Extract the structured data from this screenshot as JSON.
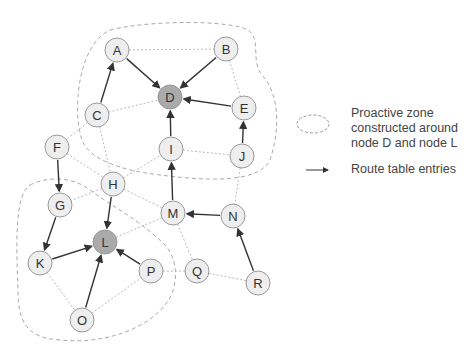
{
  "diagram": {
    "nodes": [
      {
        "id": "A",
        "x": 117,
        "y": 50,
        "highlight": false
      },
      {
        "id": "B",
        "x": 226,
        "y": 49,
        "highlight": false
      },
      {
        "id": "C",
        "x": 97,
        "y": 115,
        "highlight": false
      },
      {
        "id": "D",
        "x": 170,
        "y": 97,
        "highlight": true
      },
      {
        "id": "E",
        "x": 244,
        "y": 108,
        "highlight": false
      },
      {
        "id": "F",
        "x": 57,
        "y": 147,
        "highlight": false
      },
      {
        "id": "G",
        "x": 60,
        "y": 205,
        "highlight": false
      },
      {
        "id": "H",
        "x": 113,
        "y": 184,
        "highlight": false
      },
      {
        "id": "I",
        "x": 171,
        "y": 149,
        "highlight": false
      },
      {
        "id": "J",
        "x": 242,
        "y": 156,
        "highlight": false
      },
      {
        "id": "K",
        "x": 40,
        "y": 263,
        "highlight": false
      },
      {
        "id": "L",
        "x": 105,
        "y": 242,
        "highlight": true
      },
      {
        "id": "M",
        "x": 173,
        "y": 213,
        "highlight": false
      },
      {
        "id": "N",
        "x": 233,
        "y": 216,
        "highlight": false
      },
      {
        "id": "O",
        "x": 82,
        "y": 320,
        "highlight": false
      },
      {
        "id": "P",
        "x": 151,
        "y": 271,
        "highlight": false
      },
      {
        "id": "Q",
        "x": 197,
        "y": 271,
        "highlight": false
      },
      {
        "id": "R",
        "x": 258,
        "y": 283,
        "highlight": false
      }
    ],
    "links": [
      [
        "A",
        "B"
      ],
      [
        "B",
        "E"
      ],
      [
        "C",
        "D"
      ],
      [
        "C",
        "F"
      ],
      [
        "C",
        "H"
      ],
      [
        "F",
        "H"
      ],
      [
        "H",
        "I"
      ],
      [
        "I",
        "J"
      ],
      [
        "J",
        "N"
      ],
      [
        "H",
        "G"
      ],
      [
        "H",
        "M"
      ],
      [
        "L",
        "M"
      ],
      [
        "M",
        "Q"
      ],
      [
        "K",
        "O"
      ],
      [
        "O",
        "P"
      ],
      [
        "P",
        "Q"
      ],
      [
        "Q",
        "R"
      ]
    ],
    "routes": [
      [
        "A",
        "D"
      ],
      [
        "B",
        "D"
      ],
      [
        "E",
        "D"
      ],
      [
        "I",
        "D"
      ],
      [
        "C",
        "A"
      ],
      [
        "J",
        "E"
      ],
      [
        "M",
        "I"
      ],
      [
        "N",
        "M"
      ],
      [
        "R",
        "N"
      ],
      [
        "F",
        "G"
      ],
      [
        "G",
        "K"
      ],
      [
        "K",
        "L"
      ],
      [
        "H",
        "L"
      ],
      [
        "O",
        "L"
      ],
      [
        "P",
        "L"
      ]
    ],
    "zones": [
      {
        "name": "zone-around-D",
        "path": "M 110 30 C 150 20 230 20 248 30 C 262 40 250 60 262 75 C 280 95 280 130 270 160 C 258 185 200 180 160 175 C 120 170 90 160 82 140 C 72 110 78 45 110 30 Z"
      },
      {
        "name": "zone-around-L",
        "path": "M 30 185 C 50 175 75 178 90 190 C 110 205 140 220 165 245 C 180 262 178 290 165 305 C 150 325 110 345 60 340 C 25 338 18 320 18 290 C 16 240 15 195 30 185 Z"
      }
    ]
  },
  "legend": {
    "zone_label_lines": [
      "Proactive zone",
      "constructed around",
      "node D and node L"
    ],
    "route_label": "Route table entries"
  },
  "caption": "Figure ..."
}
